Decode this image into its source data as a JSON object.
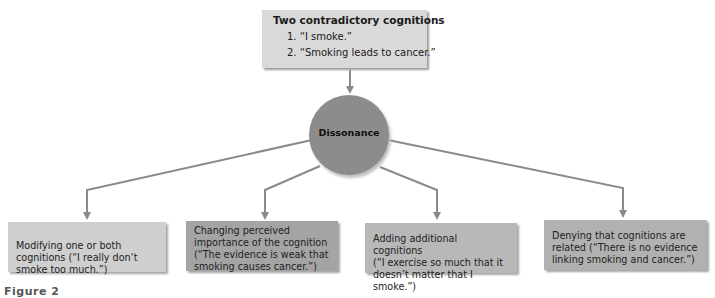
{
  "diagram": {
    "top_box": {
      "title": "Two contradictory cognitions",
      "items": [
        "1. “I smoke.”",
        "2. “Smoking leads to cancer.”"
      ]
    },
    "center": {
      "label": "Dissonance"
    },
    "outcomes": [
      {
        "text": "Modifying one or both cognitions (“I really don’t smoke too much.”)",
        "lines": [
          "Modifying one or both",
          "cognitions (“I really don’t",
          "smoke too much.”)"
        ]
      },
      {
        "text": "Changing perceived importance of the cognition (“The evidence is weak that smoking causes cancer.”)",
        "lines": [
          "Changing perceived",
          "importance of the cognition",
          "(“The evidence is weak that",
          "smoking causes cancer.”)"
        ]
      },
      {
        "text": "Adding additional cognitions (“I exercise so much that it doesn’t matter that I smoke.”)",
        "lines": [
          "Adding additional cognitions",
          "(“I exercise so much that it",
          "doesn’t matter that I smoke.”)"
        ]
      },
      {
        "text": "Denying that cognitions are related (“There is no evidence linking smoking and cancer.”)",
        "lines": [
          "Denying that cognitions are",
          "related (“There is no evidence",
          "linking smoking and cancer.”)"
        ]
      }
    ],
    "figure_label": "Figure 2",
    "colors": {
      "top_box": "#d9d9d9",
      "circle": "#8c8c8c",
      "box1": "#cfcfcf",
      "box2": "#a4a4a4",
      "box3": "#b8b8b8",
      "box4": "#b1b1b1",
      "lines": "#8a8a8a"
    }
  }
}
